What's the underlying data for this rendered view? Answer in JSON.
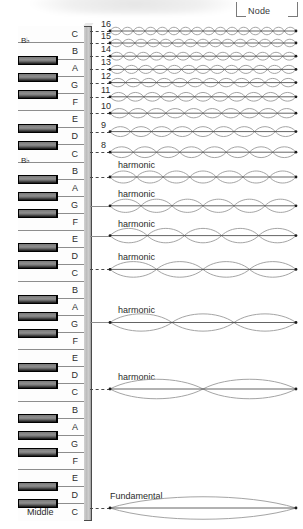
{
  "figure": {
    "title_visible": false,
    "node_callout": {
      "label": "Node"
    },
    "keyboard": {
      "middle_label": "Middle",
      "flat_label": "B♭",
      "white_keys": [
        "C",
        "B",
        "A",
        "G",
        "F",
        "E",
        "D",
        "C",
        "B",
        "A",
        "G",
        "F",
        "E",
        "D",
        "C",
        "B",
        "A",
        "G",
        "F",
        "E",
        "D",
        "C",
        "B",
        "A",
        "G",
        "F",
        "E",
        "D",
        "C"
      ],
      "note_names": [
        "C",
        "D",
        "E",
        "F",
        "G",
        "A",
        "B"
      ]
    },
    "labels": {
      "harmonic": "harmonic",
      "fundamental": "Fundamental"
    }
  },
  "chart_data": {
    "type": "line",
    "xlabel": "",
    "ylabel": "",
    "grid": false,
    "legend": null,
    "x_axis_note": "String length (fixed at both ends)",
    "harmonics": [
      {
        "number": 16,
        "number_label": "16",
        "lobes": 16,
        "note": "C",
        "name_label": "",
        "y": 31,
        "amp": 5.0
      },
      {
        "number": 15,
        "number_label": "15",
        "lobes": 15,
        "note": "B",
        "name_label": "",
        "y": 43,
        "amp": 5.0
      },
      {
        "number": 14,
        "number_label": "14",
        "lobes": 14,
        "note": "B♭",
        "name_label": "",
        "y": 56,
        "amp": 5.2
      },
      {
        "number": 13,
        "number_label": "13",
        "lobes": 13,
        "note": "A",
        "name_label": "",
        "y": 69,
        "amp": 5.4
      },
      {
        "number": 12,
        "number_label": "12",
        "lobes": 12,
        "note": "G",
        "name_label": "",
        "y": 83,
        "amp": 5.6
      },
      {
        "number": 11,
        "number_label": "11",
        "lobes": 11,
        "note": "F",
        "name_label": "",
        "y": 97,
        "amp": 5.8
      },
      {
        "number": 10,
        "number_label": "10",
        "lobes": 10,
        "note": "E",
        "name_label": "",
        "y": 113,
        "amp": 6.2
      },
      {
        "number": 9,
        "number_label": "9",
        "lobes": 9,
        "note": "D",
        "name_label": "",
        "y": 132,
        "amp": 6.6
      },
      {
        "number": 8,
        "number_label": "8",
        "lobes": 8,
        "note": "C",
        "name_label": "",
        "y": 152,
        "amp": 7.2
      },
      {
        "number": 7,
        "number_label": "",
        "lobes": 7,
        "note": "B",
        "name_label": "harmonic",
        "y": 177,
        "amp": 8.0
      },
      {
        "number": 6,
        "number_label": "",
        "lobes": 6,
        "note": "G",
        "name_label": "harmonic",
        "y": 206,
        "amp": 8.8
      },
      {
        "number": 5,
        "number_label": "",
        "lobes": 5,
        "note": "E",
        "name_label": "harmonic",
        "y": 236,
        "amp": 9.6
      },
      {
        "number": 4,
        "number_label": "",
        "lobes": 4,
        "note": "C",
        "name_label": "harmonic",
        "y": 269,
        "amp": 10.4
      },
      {
        "number": 3,
        "number_label": "",
        "lobes": 3,
        "note": "G",
        "name_label": "harmonic",
        "y": 322,
        "amp": 11.5
      },
      {
        "number": 2,
        "number_label": "",
        "lobes": 2,
        "note": "C",
        "name_label": "harmonic",
        "y": 389,
        "amp": 13.0
      },
      {
        "number": 1,
        "number_label": "",
        "lobes": 1,
        "note": "C",
        "name_label": "Fundamental",
        "y": 508,
        "amp": 15.0
      }
    ]
  }
}
